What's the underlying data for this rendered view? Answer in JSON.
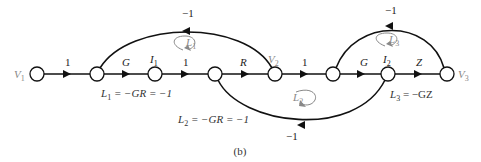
{
  "nodes": [
    {
      "id": "V1",
      "label": "V",
      "sub": "1",
      "x": 37
    },
    {
      "id": "n2",
      "label": "",
      "sub": "",
      "x": 97
    },
    {
      "id": "I1",
      "label": "I",
      "sub": "1",
      "x": 155
    },
    {
      "id": "n4",
      "label": "",
      "sub": "",
      "x": 215
    },
    {
      "id": "V2",
      "label": "V",
      "sub": "2",
      "x": 275
    },
    {
      "id": "n6",
      "label": "",
      "sub": "",
      "x": 333
    },
    {
      "id": "I2",
      "label": "I",
      "sub": "2",
      "x": 388
    },
    {
      "id": "V3",
      "label": "V",
      "sub": "3",
      "x": 447
    }
  ],
  "forward_gains": [
    "1",
    "G",
    "1",
    "R",
    "1",
    "G",
    "Z"
  ],
  "feedback": {
    "upper_left": "−1",
    "upper_right": "−1",
    "lower": "−1"
  },
  "loops": {
    "L1": {
      "name": "L",
      "sub": "1"
    },
    "L2": {
      "name": "L",
      "sub": "2"
    },
    "L3": {
      "name": "L",
      "sub": "3"
    }
  },
  "equations": {
    "L1_name": "L",
    "L1_sub": "1",
    "L1_rest": " = −GR = −1",
    "L2_name": "L",
    "L2_sub": "2",
    "L2_rest": " = −GR = −1",
    "L3_name": "L",
    "L3_sub": "3",
    "L3_rest": " = −GZ"
  },
  "caption": "(b)"
}
